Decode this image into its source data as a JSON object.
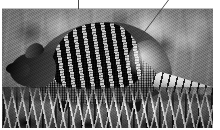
{
  "image": {
    "subject": "armadillo",
    "description": "Black and white photograph of a nine-banded armadillo standing in grass",
    "color_mode": "grayscale",
    "alt_text": "An armadillo with a banded armored shell walking through tall grass",
    "frame": {
      "border_color": "#bdbdbd",
      "background_color": "#ffffff"
    },
    "palette": {
      "shell_dark": "#2b2b2b",
      "shell_light": "#e1e1e1",
      "background_grey": "#8b8b8b",
      "grass_highlight": "#f6f6f6",
      "shadow": "#0c0c0c"
    },
    "annotations": [
      {
        "name": "vertical-leader-line",
        "x1": 78,
        "y1": 0,
        "x2": 78,
        "y2": 9
      },
      {
        "name": "diagonal-leader-line",
        "x1": 168,
        "y1": 0,
        "x2": 139,
        "y2": 39
      }
    ],
    "subject_parts": [
      {
        "name": "head",
        "label": "head"
      },
      {
        "name": "ear",
        "label": "ear"
      },
      {
        "name": "snout",
        "label": "snout"
      },
      {
        "name": "carapace",
        "label": "banded carapace"
      },
      {
        "name": "tail",
        "label": "banded tail"
      },
      {
        "name": "legs",
        "label": "legs"
      }
    ],
    "scene": {
      "foreground": "grass",
      "background": "blurred foliage"
    }
  }
}
